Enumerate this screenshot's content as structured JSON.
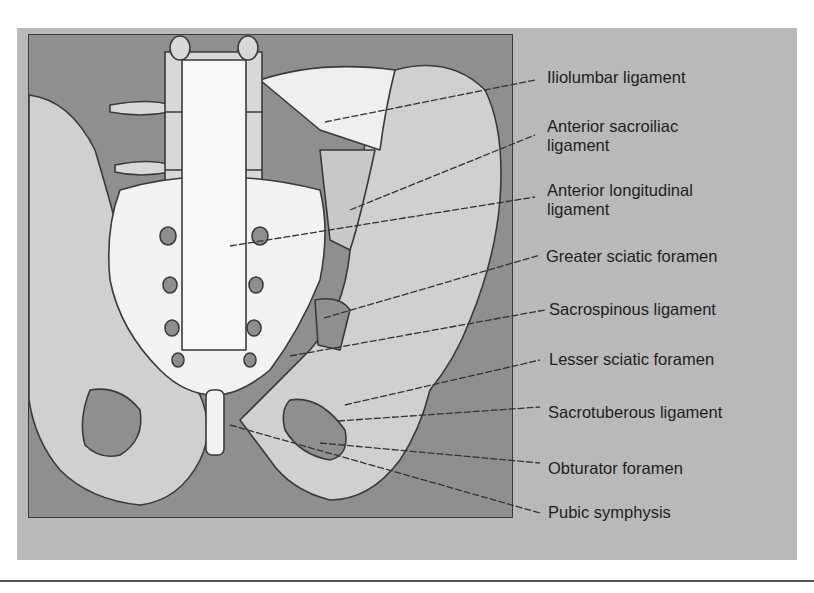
{
  "figure": {
    "labels": [
      {
        "id": "iliolumbar",
        "lines": [
          "Iliolumbar ligament"
        ]
      },
      {
        "id": "anterior-sacroiliac",
        "lines": [
          "Anterior sacroiliac",
          "ligament"
        ]
      },
      {
        "id": "anterior-longitudinal",
        "lines": [
          "Anterior longitudinal",
          "ligament"
        ]
      },
      {
        "id": "greater-sciatic",
        "lines": [
          "Greater sciatic foramen"
        ]
      },
      {
        "id": "sacrospinous",
        "lines": [
          "Sacrospinous ligament"
        ]
      },
      {
        "id": "lesser-sciatic",
        "lines": [
          "Lesser sciatic foramen"
        ]
      },
      {
        "id": "sacrotuberous",
        "lines": [
          "Sacrotuberous ligament"
        ]
      },
      {
        "id": "obturator",
        "lines": [
          "Obturator foramen"
        ]
      },
      {
        "id": "pubic-symphysis",
        "lines": [
          "Pubic symphysis"
        ]
      }
    ]
  },
  "colors": {
    "panel": "#b9b9b9",
    "figure_bg": "#8f8f8f",
    "bone_light": "#f2f2f2",
    "bone_mid": "#d2d2d2",
    "ligament": "#c4c4c4",
    "outline": "#3a3a3a"
  }
}
